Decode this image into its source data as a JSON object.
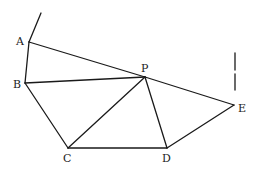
{
  "diagram": {
    "type": "geometry",
    "points": {
      "A": {
        "label": "A",
        "x": 29,
        "y": 42
      },
      "B": {
        "label": "B",
        "x": 25,
        "y": 83
      },
      "P": {
        "label": "P",
        "x": 145,
        "y": 77
      },
      "C": {
        "label": "C",
        "x": 68,
        "y": 148
      },
      "D": {
        "label": "D",
        "x": 167,
        "y": 148
      },
      "E": {
        "label": "E",
        "x": 234,
        "y": 105
      }
    },
    "segments": [
      [
        "A",
        "B"
      ],
      [
        "A",
        "P"
      ],
      [
        "P",
        "E"
      ],
      [
        "B",
        "P"
      ],
      [
        "B",
        "C"
      ],
      [
        "C",
        "P"
      ],
      [
        "P",
        "D"
      ],
      [
        "C",
        "D"
      ],
      [
        "D",
        "E"
      ]
    ],
    "extensions": [
      {
        "name": "ray-from-A",
        "from": [
          29,
          42
        ],
        "to": [
          41,
          13
        ]
      },
      {
        "name": "vertical-mark-above-E",
        "from": [
          235,
          53
        ],
        "to": [
          235,
          98
        ],
        "style": "broken"
      }
    ],
    "line_color": "#1a1a1a"
  }
}
